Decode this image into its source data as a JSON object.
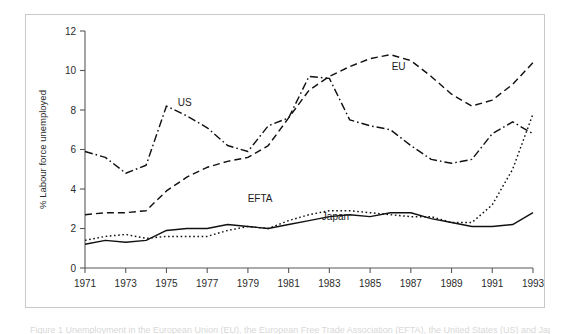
{
  "figure": {
    "caption_fragment": "Figure 1   Unemployment in the European Union (EU), the European Free Trade Association (EFTA), the United States (US) and Japan, 1971-1993"
  },
  "chart_data": {
    "type": "line",
    "title": "",
    "xlabel": "",
    "ylabel": "% Labour force unemployed",
    "xlim": [
      1971,
      1993
    ],
    "ylim": [
      0,
      12
    ],
    "grid": false,
    "legend_position": "inline-annotations",
    "xticks": [
      1971,
      1973,
      1975,
      1977,
      1979,
      1981,
      1983,
      1985,
      1987,
      1989,
      1991,
      1993
    ],
    "yticks": [
      0,
      2,
      4,
      6,
      8,
      10,
      12
    ],
    "x": [
      1971,
      1972,
      1973,
      1974,
      1975,
      1976,
      1977,
      1978,
      1979,
      1980,
      1981,
      1982,
      1983,
      1984,
      1985,
      1986,
      1987,
      1988,
      1989,
      1990,
      1991,
      1992,
      1993
    ],
    "series": [
      {
        "name": "EU",
        "label": "EU",
        "style": "dashed",
        "label_x": 1986.4,
        "label_y": 10.05,
        "values": [
          2.7,
          2.8,
          2.8,
          2.9,
          3.9,
          4.6,
          5.1,
          5.4,
          5.6,
          6.2,
          7.6,
          9.0,
          9.7,
          10.2,
          10.6,
          10.8,
          10.5,
          9.7,
          8.8,
          8.2,
          8.5,
          9.3,
          10.4
        ]
      },
      {
        "name": "US",
        "label": "US",
        "style": "dashdot",
        "label_x": 1975.9,
        "label_y": 8.2,
        "values": [
          5.9,
          5.6,
          4.8,
          5.2,
          8.2,
          7.7,
          7.1,
          6.2,
          5.9,
          7.2,
          7.6,
          9.7,
          9.6,
          7.5,
          7.2,
          7.0,
          6.2,
          5.5,
          5.3,
          5.5,
          6.8,
          7.4,
          6.8
        ]
      },
      {
        "name": "EFTA",
        "label": "EFTA",
        "style": "dotted",
        "label_x": 1979.6,
        "label_y": 3.35,
        "values": [
          1.4,
          1.6,
          1.7,
          1.5,
          1.6,
          1.6,
          1.6,
          1.9,
          2.1,
          2.0,
          2.4,
          2.7,
          2.9,
          2.9,
          2.8,
          2.7,
          2.6,
          2.6,
          2.3,
          2.3,
          3.2,
          5.0,
          7.8
        ]
      },
      {
        "name": "Japan",
        "label": "Japan",
        "style": "solid",
        "label_x": 1983.3,
        "label_y": 2.45,
        "values": [
          1.2,
          1.4,
          1.3,
          1.4,
          1.9,
          2.0,
          2.0,
          2.2,
          2.1,
          2.0,
          2.2,
          2.4,
          2.6,
          2.7,
          2.6,
          2.8,
          2.8,
          2.5,
          2.3,
          2.1,
          2.1,
          2.2,
          2.8
        ]
      }
    ]
  }
}
